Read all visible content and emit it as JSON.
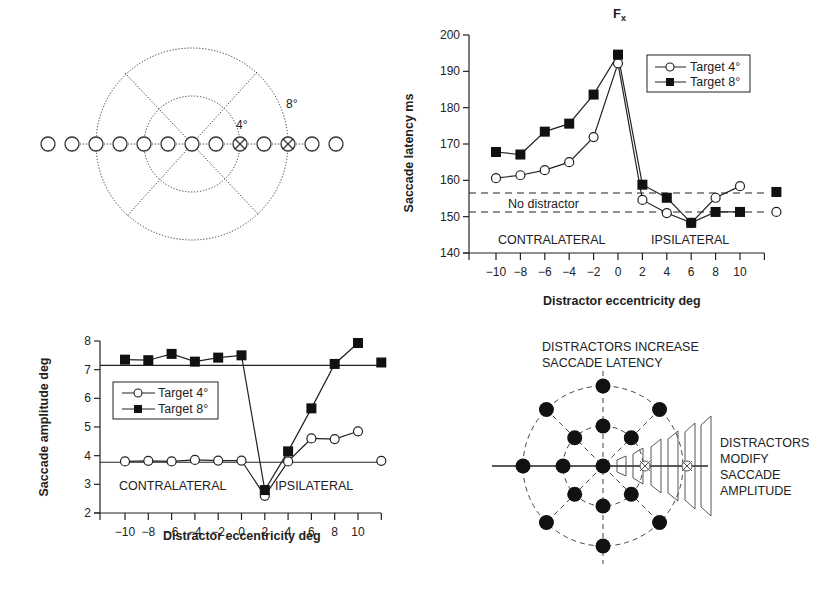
{
  "figure": {
    "diagram_top_left": {
      "ring_labels": [
        "4°",
        "8°"
      ],
      "positions_deg": [
        -12,
        -10,
        -8,
        -6,
        -4,
        -2,
        0,
        2,
        4,
        6,
        8,
        10,
        12
      ],
      "target_positions_deg": [
        4,
        8
      ]
    },
    "diagram_bottom_right": {
      "title_lines": [
        "DISTRACTORS INCREASE",
        "SACCADE LATENCY"
      ],
      "side_lines": [
        "DISTRACTORS",
        "MODIFY",
        "SACCADE",
        "AMPLITUDE"
      ]
    }
  },
  "chart_data": [
    {
      "type": "line",
      "title": "",
      "annotation_peak": "Fx",
      "xlabel": "Distractor eccentricity deg",
      "ylabel": "Saccade latency ms",
      "ylim": [
        140,
        200
      ],
      "yticks": [
        140,
        150,
        160,
        170,
        180,
        190,
        200
      ],
      "x": [
        -10,
        -8,
        -6,
        -4,
        -2,
        0,
        2,
        4,
        6,
        8,
        10
      ],
      "xtick_labels": [
        "−10",
        "−8",
        "−6",
        "−4",
        "−2",
        "0",
        "2",
        "4",
        "6",
        "8",
        "10"
      ],
      "series": [
        {
          "name": "Target 4°",
          "marker": "open-circle",
          "values": [
            160.6,
            161.4,
            162.8,
            165.0,
            171.9,
            192.2,
            154.6,
            151.0,
            148.3,
            155.2,
            158.4
          ],
          "no_distractor": 151.3
        },
        {
          "name": "Target 8°",
          "marker": "filled-square",
          "values": [
            167.8,
            167.1,
            173.4,
            175.6,
            183.6,
            194.6,
            158.8,
            155.2,
            148.3,
            151.3,
            151.3
          ],
          "no_distractor": 156.8
        }
      ],
      "reference_lines": [
        {
          "label": "No distractor",
          "value": 156.5,
          "style": "dashed"
        },
        {
          "label": "",
          "value": 151.3,
          "style": "dashed"
        }
      ],
      "region_labels": [
        "CONTRALATERAL",
        "IPSILATERAL"
      ],
      "legend": [
        "Target 4°",
        "Target 8°"
      ],
      "legend_position": "upper right",
      "grid": false
    },
    {
      "type": "line",
      "title": "",
      "xlabel": "Distractor eccentricity deg",
      "ylabel": "Saccade amplitude deg",
      "ylim": [
        2,
        8
      ],
      "yticks": [
        2,
        3,
        4,
        5,
        6,
        7,
        8
      ],
      "x": [
        -10,
        -8,
        -6,
        -4,
        -2,
        0,
        2,
        4,
        6,
        8,
        10
      ],
      "xtick_labels": [
        "−10",
        "−8",
        "−6",
        "−4",
        "−2",
        "0",
        "2",
        "4",
        "6",
        "8",
        "10"
      ],
      "series": [
        {
          "name": "Target 4°",
          "marker": "open-circle",
          "values": [
            3.8,
            3.82,
            3.8,
            3.85,
            3.83,
            3.83,
            2.6,
            3.8,
            4.6,
            4.58,
            4.85
          ],
          "no_distractor": 3.82
        },
        {
          "name": "Target 8°",
          "marker": "filled-square",
          "values": [
            7.35,
            7.33,
            7.55,
            7.28,
            7.42,
            7.5,
            2.8,
            4.15,
            5.65,
            7.2,
            7.93
          ],
          "no_distractor": 7.25
        }
      ],
      "reference_lines": [
        {
          "label": "",
          "value": 7.15,
          "style": "solid"
        },
        {
          "label": "",
          "value": 3.77,
          "style": "solid"
        }
      ],
      "region_labels": [
        "CONTRALATERAL",
        "IPSILATERAL"
      ],
      "legend": [
        "Target 4°",
        "Target 8°"
      ],
      "legend_position": "upper left",
      "grid": false
    }
  ]
}
